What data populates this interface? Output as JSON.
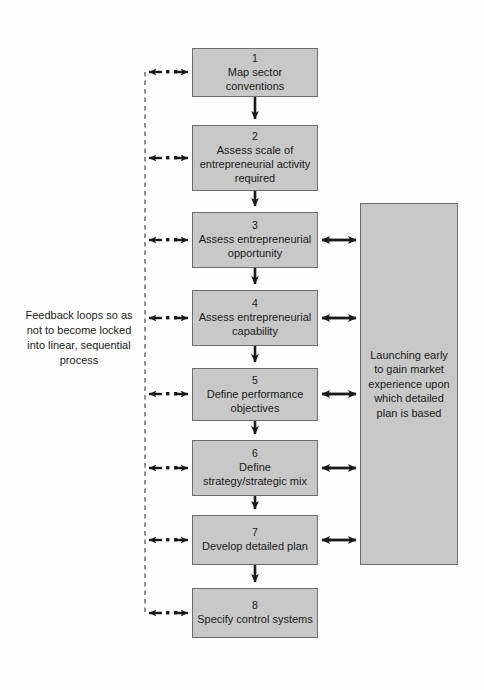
{
  "diagram": {
    "box_fill": "#c8c8c8",
    "box_stroke": "#6d6d6d",
    "line_color": "#1a1a1a",
    "background": "#ffffff"
  },
  "steps": [
    {
      "num": "1",
      "label": "Map sector conventions",
      "x": 192,
      "y": 48,
      "w": 126,
      "h": 49
    },
    {
      "num": "2",
      "label": "Assess scale of entrepreneurial activity required",
      "x": 192,
      "y": 125,
      "w": 126,
      "h": 66
    },
    {
      "num": "3",
      "label": "Assess entrepreneurial opportunity",
      "x": 192,
      "y": 212,
      "w": 126,
      "h": 56
    },
    {
      "num": "4",
      "label": "Assess entrepreneurial capability",
      "x": 192,
      "y": 290,
      "w": 126,
      "h": 56
    },
    {
      "num": "5",
      "label": "Define performance objectives",
      "x": 192,
      "y": 368,
      "w": 126,
      "h": 53
    },
    {
      "num": "6",
      "label": "Define strategy/strategic mix",
      "x": 192,
      "y": 440,
      "w": 126,
      "h": 56
    },
    {
      "num": "7",
      "label": "Develop detailed plan",
      "x": 192,
      "y": 515,
      "w": 126,
      "h": 50
    },
    {
      "num": "8",
      "label": "Specify control systems",
      "x": 192,
      "y": 588,
      "w": 126,
      "h": 50
    }
  ],
  "side_panel": {
    "label": "Launching early to gain market experience upon which detailed plan is based"
  },
  "caption": {
    "label": "Feedback loops so as not to become locked into linear, sequential process"
  },
  "connectors": {
    "feedback_label": "dashed feedback loop",
    "flow_label": "sequential flow arrow",
    "exchange_label": "two-way exchange arrow",
    "feedback_rail_x": 145,
    "feedback_rows": [
      72,
      158,
      240,
      318,
      394,
      468,
      540,
      613
    ],
    "exchange_rows": [
      240,
      318,
      394,
      468,
      540
    ]
  }
}
